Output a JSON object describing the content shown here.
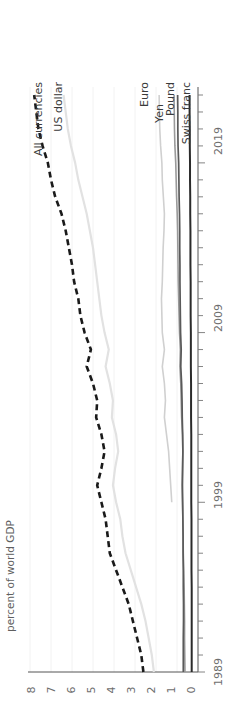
{
  "chart_data": {
    "type": "line",
    "title": "",
    "subtitle": "",
    "xlabel": "",
    "ylabel": "percent of world GDP",
    "orientation": "rotated-90-ccw",
    "grid": "vertical-light",
    "legend_position": "inline-series-labels-top",
    "xlim": [
      1989,
      2023
    ],
    "ylim": [
      0,
      8
    ],
    "xticks": [
      1989,
      1999,
      2009,
      2019
    ],
    "xtick_labels": [
      "1989",
      "1999",
      "2009",
      "2019"
    ],
    "xminor_step": 1,
    "yticks": [
      0,
      1,
      2,
      3,
      4,
      5,
      6,
      7,
      8
    ],
    "ytick_labels": [
      "0",
      "1",
      "2",
      "3",
      "4",
      "5",
      "6",
      "7",
      "8"
    ],
    "x": [
      1989,
      1990,
      1991,
      1992,
      1993,
      1994,
      1995,
      1996,
      1997,
      1998,
      1999,
      2000,
      2001,
      2002,
      2003,
      2004,
      2005,
      2006,
      2007,
      2008,
      2009,
      2010,
      2011,
      2012,
      2013,
      2014,
      2015,
      2016,
      2017,
      2018,
      2019,
      2020,
      2021,
      2022,
      2023
    ],
    "series": [
      {
        "name": "All currencies",
        "color": "#1a1a1a",
        "style": "dashed",
        "width": 2.6,
        "label_side": "left",
        "values": [
          2.6,
          2.7,
          2.9,
          3.1,
          3.3,
          3.6,
          3.9,
          4.2,
          4.3,
          4.4,
          4.6,
          4.8,
          4.6,
          4.45,
          4.6,
          4.85,
          4.8,
          5.0,
          5.3,
          5.1,
          5.4,
          5.6,
          5.7,
          5.9,
          6.0,
          6.15,
          6.3,
          6.5,
          6.8,
          7.0,
          7.15,
          7.4,
          7.6,
          7.7,
          7.8
        ]
      },
      {
        "name": "US dollar",
        "color": "#e2e2e2",
        "style": "solid",
        "width": 2.2,
        "label_side": "left",
        "values": [
          2.1,
          2.2,
          2.35,
          2.5,
          2.7,
          2.95,
          3.2,
          3.45,
          3.6,
          3.7,
          3.9,
          4.05,
          3.95,
          3.8,
          3.9,
          4.1,
          4.05,
          4.2,
          4.4,
          4.25,
          4.45,
          4.6,
          4.7,
          4.8,
          4.9,
          5.0,
          5.15,
          5.3,
          5.5,
          5.7,
          5.85,
          6.05,
          6.2,
          6.3,
          6.4
        ]
      },
      {
        "name": "Euro",
        "color": "#d0d0d0",
        "style": "solid",
        "width": 1.6,
        "label_side": "right",
        "values": [
          null,
          null,
          null,
          null,
          null,
          null,
          null,
          null,
          null,
          null,
          1.25,
          1.3,
          1.35,
          1.4,
          1.5,
          1.6,
          1.55,
          1.6,
          1.7,
          1.6,
          1.7,
          1.72,
          1.74,
          1.7,
          1.68,
          1.66,
          1.62,
          1.6,
          1.65,
          1.7,
          1.72,
          1.78,
          1.82,
          1.84,
          1.85
        ]
      },
      {
        "name": "Yen",
        "color": "#9a9a9a",
        "style": "solid",
        "width": 1.6,
        "label_side": "right",
        "values": [
          0.62,
          0.63,
          0.64,
          0.64,
          0.65,
          0.66,
          0.68,
          0.7,
          0.71,
          0.72,
          0.74,
          0.76,
          0.74,
          0.72,
          0.74,
          0.78,
          0.8,
          0.82,
          0.86,
          0.84,
          0.88,
          0.9,
          0.92,
          0.94,
          0.95,
          0.96,
          0.97,
          0.99,
          1.02,
          1.04,
          1.06,
          1.1,
          1.12,
          1.13,
          1.14
        ]
      },
      {
        "name": "Pound",
        "color": "#5a5a5a",
        "style": "solid",
        "width": 1.7,
        "label_side": "right",
        "values": [
          0.7,
          0.7,
          0.7,
          0.69,
          0.69,
          0.7,
          0.7,
          0.71,
          0.71,
          0.72,
          0.73,
          0.74,
          0.73,
          0.72,
          0.73,
          0.75,
          0.76,
          0.78,
          0.82,
          0.8,
          0.83,
          0.84,
          0.85,
          0.86,
          0.86,
          0.87,
          0.87,
          0.88,
          0.9,
          0.91,
          0.92,
          0.95,
          0.96,
          0.96,
          0.97
        ]
      },
      {
        "name": "Swiss franc",
        "color": "#2b2b2b",
        "style": "solid",
        "width": 2.0,
        "label_side": "right",
        "values": [
          0.3,
          0.3,
          0.3,
          0.3,
          0.3,
          0.3,
          0.31,
          0.31,
          0.31,
          0.31,
          0.32,
          0.32,
          0.32,
          0.32,
          0.32,
          0.33,
          0.33,
          0.33,
          0.34,
          0.34,
          0.34,
          0.35,
          0.35,
          0.35,
          0.36,
          0.36,
          0.36,
          0.37,
          0.37,
          0.38,
          0.38,
          0.39,
          0.39,
          0.4,
          0.4
        ]
      }
    ]
  },
  "axis": {
    "y_title": "percent of world GDP"
  },
  "labels": {
    "all_currencies": "All currencies",
    "us_dollar": "US dollar",
    "euro": "Euro",
    "yen": "Yen",
    "pound": "Pound",
    "swiss_franc": "Swiss franc"
  },
  "xticks": {
    "t1989": "1989",
    "t1999": "1999",
    "t2009": "2009",
    "t2019": "2019"
  },
  "yticks": {
    "v0": "0",
    "v1": "1",
    "v2": "2",
    "v3": "3",
    "v4": "4",
    "v5": "5",
    "v6": "6",
    "v7": "7",
    "v8": "8"
  }
}
